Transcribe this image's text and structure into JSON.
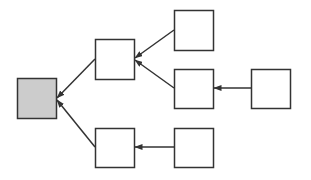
{
  "diagram": {
    "type": "tree",
    "direction": "right-to-left",
    "colors": {
      "background": "#ffffff",
      "stroke": "#333333",
      "root_fill": "#cccccc",
      "node_fill": "#ffffff"
    },
    "nodes": [
      {
        "id": "root",
        "label": "",
        "x": 17,
        "y": 78,
        "w": 39,
        "h": 40,
        "fill": "#cccccc"
      },
      {
        "id": "a",
        "label": "",
        "x": 95,
        "y": 39,
        "w": 39,
        "h": 40,
        "fill": "#ffffff"
      },
      {
        "id": "b",
        "label": "",
        "x": 174,
        "y": 10,
        "w": 39,
        "h": 40,
        "fill": "#ffffff"
      },
      {
        "id": "c",
        "label": "",
        "x": 174,
        "y": 69,
        "w": 39,
        "h": 39,
        "fill": "#ffffff"
      },
      {
        "id": "d",
        "label": "",
        "x": 251,
        "y": 69,
        "w": 39,
        "h": 39,
        "fill": "#ffffff"
      },
      {
        "id": "e",
        "label": "",
        "x": 95,
        "y": 128,
        "w": 39,
        "h": 39,
        "fill": "#ffffff"
      },
      {
        "id": "f",
        "label": "",
        "x": 174,
        "y": 128,
        "w": 39,
        "h": 39,
        "fill": "#ffffff"
      }
    ],
    "edges": [
      {
        "from": "a",
        "to": "root",
        "x1": 95,
        "y1": 59,
        "x2": 57,
        "y2": 98
      },
      {
        "from": "e",
        "to": "root",
        "x1": 95,
        "y1": 147,
        "x2": 57,
        "y2": 100
      },
      {
        "from": "b",
        "to": "a",
        "x1": 174,
        "y1": 30,
        "x2": 135,
        "y2": 58
      },
      {
        "from": "c",
        "to": "a",
        "x1": 174,
        "y1": 88,
        "x2": 135,
        "y2": 60
      },
      {
        "from": "d",
        "to": "c",
        "x1": 251,
        "y1": 88,
        "x2": 214,
        "y2": 88
      },
      {
        "from": "f",
        "to": "e",
        "x1": 174,
        "y1": 147,
        "x2": 135,
        "y2": 147
      }
    ]
  }
}
